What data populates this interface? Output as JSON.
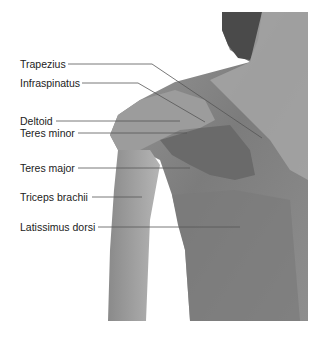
{
  "figure": {
    "labels": [
      {
        "id": "trapezius",
        "text": "Trapezius"
      },
      {
        "id": "infraspinatus",
        "text": "Infraspinatus"
      },
      {
        "id": "deltoid",
        "text": "Deltoid"
      },
      {
        "id": "teres-minor",
        "text": "Teres minor"
      },
      {
        "id": "teres-major",
        "text": "Teres major"
      },
      {
        "id": "triceps-brachii",
        "text": "Triceps brachii"
      },
      {
        "id": "latissimus-dorsi",
        "text": "Latissimus dorsi"
      }
    ],
    "colors": {
      "background": "#ffffff",
      "tissue_light": "#b8b8b8",
      "tissue_dark": "#5a5a5a",
      "label_text": "#222222",
      "leader_line": "#555555"
    }
  }
}
